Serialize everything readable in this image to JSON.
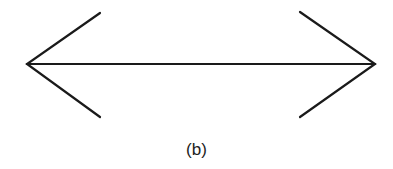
{
  "figure": {
    "caption": "(b)",
    "stroke_color": "#1a1a1a"
  }
}
